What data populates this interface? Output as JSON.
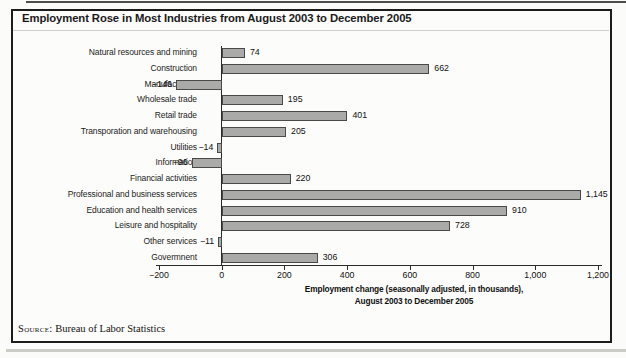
{
  "page": {
    "source_label": "Source:",
    "source_text": "Bureau of Labor Statistics"
  },
  "chart_data": {
    "type": "bar",
    "orientation": "horizontal",
    "title": "Employment Rose in Most Industries from August 2003 to December 2005",
    "categories": [
      "Natural resources and mining",
      "Construction",
      "Manufacturing",
      "Wholesale trade",
      "Retail trade",
      "Transporation and warehousing",
      "Utilities",
      "Information",
      "Financial activities",
      "Professional and business services",
      "Education and health services",
      "Leisure and hospitality",
      "Other services",
      "Govermnent"
    ],
    "values": [
      74,
      662,
      -146,
      195,
      401,
      205,
      -14,
      -96,
      220,
      1145,
      910,
      728,
      -11,
      306
    ],
    "value_labels": [
      "74",
      "662",
      "−146",
      "195",
      "401",
      "205",
      "−14",
      "−96",
      "220",
      "1,145",
      "910",
      "728",
      "−11",
      "306"
    ],
    "xlim": [
      -200,
      1200
    ],
    "xtick_values": [
      -200,
      0,
      200,
      400,
      600,
      800,
      1000,
      1200
    ],
    "xtick_labels": [
      "−200",
      "0",
      "200",
      "400",
      "600",
      "800",
      "1,000",
      "1,200"
    ],
    "xlabel_lines": [
      "Employment change (seasonally adjusted, in thousands),",
      "August 2003 to December 2005"
    ],
    "grid": false,
    "legend": null,
    "bar_color": "#aaaaa8",
    "bar_border_color": "#4a4a4a",
    "axis_color": "#2b2b2b"
  }
}
